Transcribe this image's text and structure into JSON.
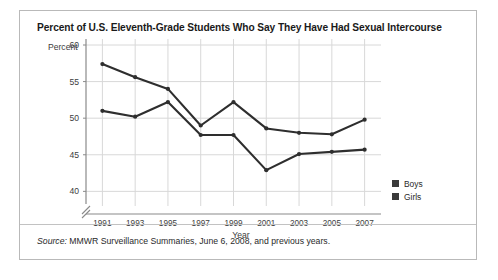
{
  "figure": {
    "title": "Percent of U.S. Eleventh-Grade Students Who Say They Have Had Sexual Intercourse",
    "source_label": "Source:",
    "source_text": " MMWR Surveillance Summaries, June 6, 2008, and previous years."
  },
  "legend": {
    "items": [
      {
        "label": "Boys",
        "color": "#3a3a3a"
      },
      {
        "label": "Girls",
        "color": "#3a3a3a"
      }
    ]
  },
  "chart_data": {
    "type": "line",
    "title": "Percent of U.S. Eleventh-Grade Students Who Say They Have Had Sexual Intercourse",
    "xlabel": "Year",
    "ylabel": "Percent",
    "categories": [
      "1991",
      "1993",
      "1995",
      "1997",
      "1999",
      "2001",
      "2003",
      "2005",
      "2007"
    ],
    "x": [
      1991,
      1993,
      1995,
      1997,
      1999,
      2001,
      2003,
      2005,
      2007
    ],
    "xlim": [
      1990,
      2008
    ],
    "ylim": [
      38,
      60
    ],
    "yticks": [
      40,
      45,
      50,
      55,
      60
    ],
    "ytick_labels": [
      "40",
      "45",
      "50",
      "55",
      "60"
    ],
    "y_axis_break": true,
    "grid": true,
    "legend_position": "right",
    "line_color": "#2e2e2e",
    "series": [
      {
        "name": "Boys",
        "color": "#2e2e2e",
        "values": [
          57.4,
          55.6,
          54.0,
          49.0,
          52.2,
          48.6,
          48.0,
          47.8,
          49.8
        ]
      },
      {
        "name": "Girls",
        "color": "#2e2e2e",
        "values": [
          51.0,
          50.2,
          52.2,
          47.7,
          47.7,
          42.9,
          45.1,
          45.4,
          45.7
        ]
      }
    ]
  }
}
